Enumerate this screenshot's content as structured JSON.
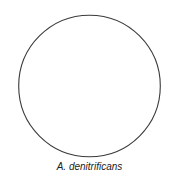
{
  "diagram": {
    "type": "circular-genome-map",
    "shape": "circle",
    "stroke_color": "#3a3a3a",
    "fill_color": "#ffffff",
    "caption": "A. denitrificans"
  }
}
